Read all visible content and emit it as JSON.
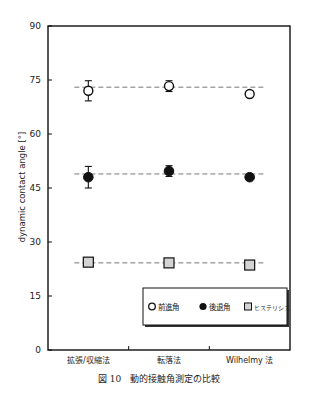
{
  "chart_data": {
    "type": "scatter",
    "title": "",
    "caption": "図 10　動的接触角測定の比較",
    "xlabel": "",
    "ylabel": "dynamic contact angle [°]",
    "ylim": [
      0,
      90
    ],
    "yticks": [
      0,
      15,
      30,
      45,
      60,
      75,
      90
    ],
    "grid": false,
    "legend_position": "lower right (inside)",
    "categories": [
      "拡張/収縮法",
      "転落法",
      "Wilhelmy 法"
    ],
    "series": [
      {
        "name": "前進角",
        "marker": "open-circle",
        "values": [
          72.0,
          73.3,
          71.1
        ],
        "errors": [
          2.8,
          1.5,
          0.0
        ],
        "reference_line": 73.0
      },
      {
        "name": "後退角",
        "marker": "filled-circle",
        "values": [
          48.0,
          49.7,
          48.0
        ],
        "errors": [
          3.0,
          1.5,
          0.0
        ],
        "reference_line": 48.9
      },
      {
        "name": "ヒステリシス",
        "marker": "gray-square",
        "values": [
          24.4,
          24.2,
          23.6
        ],
        "errors": [
          0.0,
          0.0,
          0.0
        ],
        "reference_line": 24.2
      }
    ]
  },
  "colors": {
    "axis": "#111111",
    "dashed_line": "#777777",
    "square_fill": "#d4d4d4",
    "marker_stroke": "#111111"
  }
}
